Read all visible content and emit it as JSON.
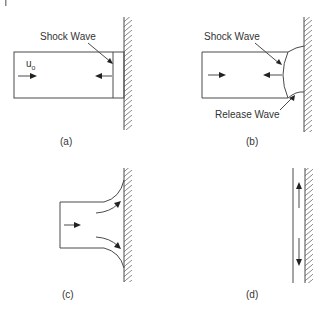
{
  "figure": {
    "panels": [
      {
        "id": "a",
        "caption": "(a)",
        "labels": {
          "shock": "Shock Wave",
          "velocity": "u",
          "velocity_sub": "o"
        }
      },
      {
        "id": "b",
        "caption": "(b)",
        "labels": {
          "shock": "Shock Wave",
          "release": "Release Wave"
        }
      },
      {
        "id": "c",
        "caption": "(c)"
      },
      {
        "id": "d",
        "caption": "(d)"
      }
    ]
  },
  "colors": {
    "line": "#4a4a4a",
    "text": "#333333",
    "background": "#ffffff"
  }
}
